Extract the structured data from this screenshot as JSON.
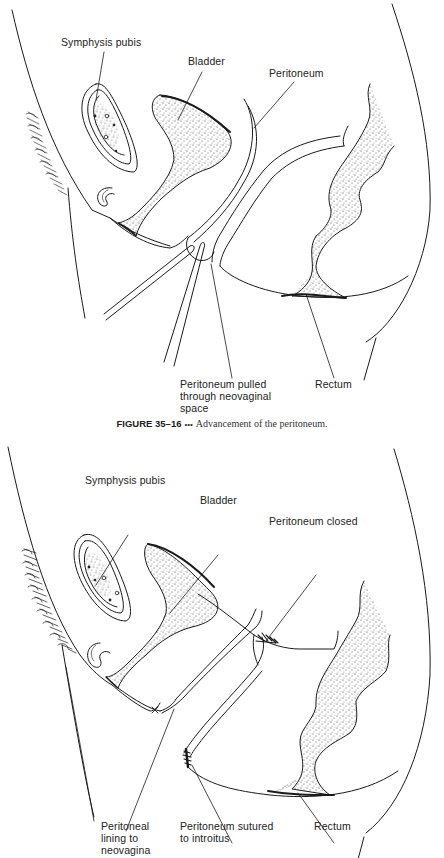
{
  "figures": [
    {
      "id": "35-16",
      "labels": {
        "symphysis": "Symphysis pubis",
        "bladder": "Bladder",
        "peritoneum": "Peritoneum",
        "pulled_1": "Peritoneum pulled",
        "pulled_2": "through neovaginal",
        "pulled_3": "space",
        "rectum": "Rectum"
      },
      "caption": {
        "number": "FIGURE 35–16",
        "separator": "•••",
        "text": "Advancement of the peritoneum."
      }
    },
    {
      "id": "35-17",
      "labels": {
        "symphysis": "Symphysis pubis",
        "bladder": "Bladder",
        "closed": "Peritoneum closed",
        "lining_1": "Peritoneal",
        "lining_2": "lining to",
        "lining_3": "neovagina",
        "sutured_1": "Peritoneum sutured",
        "sutured_2": "to introitus",
        "rectum": "Rectum"
      },
      "caption": {
        "partially_visible": true
      }
    }
  ],
  "colors": {
    "ink": "#1a1a1a",
    "stipple": "#3a3a3a",
    "background": "#ffffff"
  }
}
